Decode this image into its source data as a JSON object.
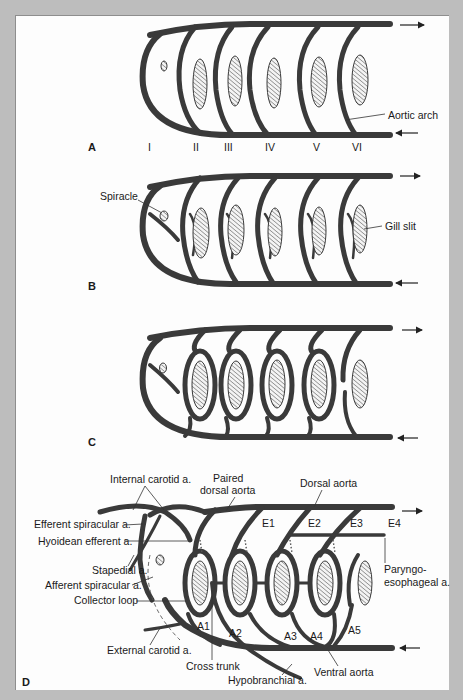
{
  "figure": {
    "colors": {
      "background": "#bdbdbd",
      "panel": "#fdfdfd",
      "vessel": "#3a3a3a",
      "text": "#1a1a1a"
    },
    "panels": [
      {
        "id": "A",
        "label": "A",
        "arch_numerals": [
          "I",
          "II",
          "III",
          "IV",
          "V",
          "VI"
        ],
        "annotations": [
          {
            "text": "Aortic arch"
          }
        ]
      },
      {
        "id": "B",
        "label": "B",
        "annotations": [
          {
            "text": "Spiracle"
          },
          {
            "text": "Gill slit"
          }
        ]
      },
      {
        "id": "C",
        "label": "C",
        "annotations": []
      },
      {
        "id": "D",
        "label": "D",
        "efferent_labels": [
          "E1",
          "E2",
          "E3",
          "E4"
        ],
        "afferent_labels": [
          "A1",
          "A2",
          "A3",
          "A4",
          "A5"
        ],
        "annotations": [
          {
            "text": "Internal carotid a."
          },
          {
            "text": "Paired"
          },
          {
            "text": "dorsal aorta"
          },
          {
            "text": "Dorsal aorta"
          },
          {
            "text": "Efferent spiracular a."
          },
          {
            "text": "Hyoidean efferent a."
          },
          {
            "text": "Stapedial a."
          },
          {
            "text": "Afferent spiracular a."
          },
          {
            "text": "Collector loop"
          },
          {
            "text": "External carotid a."
          },
          {
            "text": "Cross trunk"
          },
          {
            "text": "Hypobranchial a."
          },
          {
            "text": "Ventral aorta"
          },
          {
            "text": "Paryngo-"
          },
          {
            "text": "esophageal a."
          }
        ]
      }
    ]
  }
}
